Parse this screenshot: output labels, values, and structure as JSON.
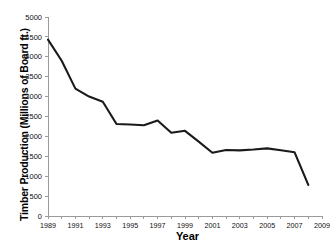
{
  "chart_data": {
    "type": "line",
    "title": "",
    "xlabel": "Year",
    "ylabel": "Timber Production (Millions of Board ft.)",
    "xlim": [
      1989,
      2009
    ],
    "ylim": [
      0,
      5000
    ],
    "grid": false,
    "legend": false,
    "line_color": "#1a1a1a",
    "x": [
      1989,
      1990,
      1991,
      1992,
      1993,
      1994,
      1995,
      1996,
      1997,
      1998,
      1999,
      2000,
      2001,
      2002,
      2003,
      2004,
      2005,
      2006,
      2007,
      2008
    ],
    "values": [
      4430,
      3900,
      3200,
      3000,
      2870,
      2310,
      2300,
      2280,
      2400,
      2090,
      2140,
      1870,
      1590,
      1660,
      1650,
      1670,
      1700,
      1650,
      1600,
      780
    ],
    "series": [
      {
        "name": "Timber Production",
        "values": [
          4430,
          3900,
          3200,
          3000,
          2870,
          2310,
          2300,
          2280,
          2400,
          2090,
          2140,
          1870,
          1590,
          1660,
          1650,
          1670,
          1700,
          1650,
          1600,
          780
        ]
      }
    ],
    "y_ticks": [
      0,
      500,
      1000,
      1500,
      2000,
      2500,
      3000,
      3500,
      4000,
      4500,
      5000
    ],
    "y_tick_labels": [
      "0",
      "500",
      "1000",
      "1500",
      "2000",
      "2500",
      "3000",
      "3500",
      "4000",
      "4500",
      "5000"
    ],
    "x_ticks": [
      1989,
      1990,
      1991,
      1992,
      1993,
      1994,
      1995,
      1996,
      1997,
      1998,
      1999,
      2000,
      2001,
      2002,
      2003,
      2004,
      2005,
      2006,
      2007,
      2008,
      2009
    ],
    "x_tick_labels": [
      "1989",
      "",
      "1991",
      "",
      "1993",
      "",
      "1995",
      "",
      "1997",
      "",
      "1999",
      "",
      "2001",
      "",
      "2003",
      "",
      "2005",
      "",
      "2007",
      "",
      "2009"
    ]
  }
}
